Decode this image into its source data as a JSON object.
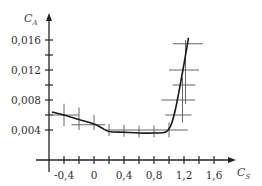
{
  "chart_data": {
    "type": "line",
    "title": "",
    "xlabel": "C_S",
    "ylabel": "C_A",
    "xlim": [
      -0.6,
      1.85
    ],
    "ylim": [
      0,
      0.0175
    ],
    "grid": false,
    "legend": null,
    "x_ticks": [
      -0.4,
      -0.2,
      0,
      0.2,
      0.4,
      0.6,
      0.8,
      1.0,
      1.2,
      1.4,
      1.6
    ],
    "x_tick_labels": [
      {
        "value": -0.4,
        "label": "-0,4"
      },
      {
        "value": 0,
        "label": "0"
      },
      {
        "value": 0.4,
        "label": "0,4"
      },
      {
        "value": 0.8,
        "label": "0,8"
      },
      {
        "value": 1.2,
        "label": "1,2"
      },
      {
        "value": 1.6,
        "label": "1,6"
      }
    ],
    "y_ticks": [
      0.004,
      0.006,
      0.008,
      0.01,
      0.012,
      0.014,
      0.016
    ],
    "y_tick_labels": [
      {
        "value": 0.004,
        "label": "0,004"
      },
      {
        "value": 0.008,
        "label": "0,008"
      },
      {
        "value": 0.012,
        "label": "0,012"
      },
      {
        "value": 0.016,
        "label": "0,016"
      }
    ],
    "series": [
      {
        "name": "C_A vs C_S",
        "x": [
          -0.56,
          -0.4,
          -0.2,
          0.0,
          0.1,
          0.2,
          0.4,
          0.6,
          0.8,
          0.95,
          1.02,
          1.08,
          1.14,
          1.2,
          1.26
        ],
        "y": [
          0.0064,
          0.006,
          0.0054,
          0.0048,
          0.0043,
          0.0038,
          0.0037,
          0.0036,
          0.0036,
          0.0037,
          0.0045,
          0.0065,
          0.0095,
          0.0128,
          0.0163
        ]
      }
    ],
    "error_bars": [
      {
        "x": -0.4,
        "y": 0.006,
        "x_err": [
          -0.55,
          -0.2
        ],
        "y_err": [
          0.0045,
          0.0075
        ]
      },
      {
        "x": -0.2,
        "y": 0.0054,
        "x_err": null,
        "y_err": [
          0.004,
          0.007
        ]
      },
      {
        "x": 0.0,
        "y": 0.0047,
        "x_err": [
          -0.3,
          0.15
        ],
        "y_err": [
          0.004,
          0.006
        ]
      },
      {
        "x": 0.2,
        "y": 0.0038,
        "x_err": null,
        "y_err": [
          0.0032,
          0.0048
        ]
      },
      {
        "x": 0.4,
        "y": 0.0037,
        "x_err": null,
        "y_err": [
          0.0031,
          0.0047
        ]
      },
      {
        "x": 0.6,
        "y": 0.0036,
        "x_err": null,
        "y_err": [
          0.003,
          0.0046
        ]
      },
      {
        "x": 0.8,
        "y": 0.0036,
        "x_err": null,
        "y_err": [
          0.003,
          0.0046
        ]
      },
      {
        "x": 1.0,
        "y": 0.004,
        "x_err": [
          0.15,
          1.25
        ],
        "y_err": [
          0.003,
          0.005
        ]
      },
      {
        "x": 1.12,
        "y": 0.006,
        "x_err": [
          0.95,
          1.3
        ],
        "y_err": null
      },
      {
        "x": 1.15,
        "y": 0.008,
        "x_err": [
          0.9,
          1.35
        ],
        "y_err": null
      },
      {
        "x": 1.18,
        "y": 0.01,
        "x_err": [
          1.05,
          1.35
        ],
        "y_err": [
          0.005,
          0.011
        ]
      },
      {
        "x": 1.2,
        "y": 0.012,
        "x_err": [
          1.0,
          1.4
        ],
        "y_err": null
      },
      {
        "x": 1.22,
        "y": 0.0155,
        "x_err": [
          1.05,
          1.45
        ],
        "y_err": [
          0.0075,
          0.016
        ]
      }
    ]
  },
  "axes": {
    "y_label_main": "C",
    "y_label_sub": "A",
    "x_label_main": "C",
    "x_label_sub": "S"
  }
}
